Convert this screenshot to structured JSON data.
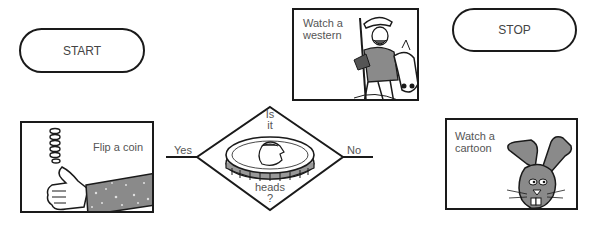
{
  "diagram": {
    "type": "flowchart",
    "start": {
      "label": "START"
    },
    "stop": {
      "label": "STOP"
    },
    "process_flip": {
      "label": "Flip a coin",
      "illustration": "hand-flipping-coin"
    },
    "decision": {
      "line1": "Is",
      "line2": "it",
      "line3": "heads",
      "line4": "?",
      "illustration": "coin-with-queen-head"
    },
    "process_western": {
      "line1": "Watch a",
      "line2": "western",
      "illustration": "cowboy-on-horse"
    },
    "process_cartoon": {
      "line1": "Watch a",
      "line2": "cartoon",
      "illustration": "rabbit"
    },
    "edges": {
      "yes": {
        "label": "Yes"
      },
      "no": {
        "label": "No"
      }
    },
    "colors": {
      "stroke": "#1a1a1a",
      "text": "#555555",
      "shading": "#8a8a8a"
    }
  }
}
